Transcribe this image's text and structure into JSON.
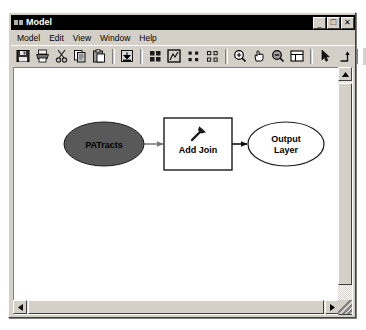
{
  "window": {
    "title": "Model",
    "title_icon": "model-window-icon",
    "controls": [
      {
        "name": "minimize-button",
        "glyph": "_"
      },
      {
        "name": "maximize-button",
        "glyph": "□"
      },
      {
        "name": "close-button",
        "glyph": "✕"
      }
    ]
  },
  "menu": {
    "items": [
      {
        "label": "Model"
      },
      {
        "label": "Edit"
      },
      {
        "label": "View"
      },
      {
        "label": "Window"
      },
      {
        "label": "Help"
      }
    ]
  },
  "toolbar": {
    "buttons": [
      {
        "name": "save-button",
        "icon": "floppy-disk-icon",
        "tip": "Save"
      },
      {
        "name": "print-button",
        "icon": "printer-icon",
        "tip": "Print"
      },
      {
        "name": "cut-button",
        "icon": "scissors-icon",
        "tip": "Cut"
      },
      {
        "name": "copy-button",
        "icon": "copy-pages-icon",
        "tip": "Copy"
      },
      {
        "name": "paste-button",
        "icon": "clipboard-paste-icon",
        "tip": "Paste"
      },
      {
        "name": "add-data-button",
        "icon": "add-data-arrow-icon",
        "tip": "Add Data"
      },
      {
        "name": "auto-layout-button",
        "icon": "grid-squares-icon",
        "tip": "Auto Layout"
      },
      {
        "name": "full-extent-button",
        "icon": "full-extent-icon",
        "tip": "Full Extent"
      },
      {
        "name": "select-all-button",
        "icon": "four-dots-icon",
        "tip": "Select All"
      },
      {
        "name": "deselect-button",
        "icon": "four-dots-outline-icon",
        "tip": "Deselect"
      },
      {
        "name": "zoom-in-button",
        "icon": "magnifier-plus-icon",
        "tip": "Zoom In"
      },
      {
        "name": "pan-button",
        "icon": "hand-pan-icon",
        "tip": "Pan"
      },
      {
        "name": "zoom-out-button",
        "icon": "magnifier-minus-icon",
        "tip": "Zoom Out"
      },
      {
        "name": "zoom-window-button",
        "icon": "zoom-window-icon",
        "tip": "Zoom To Window"
      },
      {
        "name": "select-pointer-button",
        "icon": "arrow-pointer-icon",
        "tip": "Select"
      },
      {
        "name": "connect-button",
        "icon": "connect-elbow-arrow-icon",
        "tip": "Connect"
      },
      {
        "name": "run-button",
        "icon": "play-triangle-icon",
        "tip": "Run"
      }
    ],
    "separator_after": [
      4,
      9,
      13
    ]
  },
  "diagram": {
    "nodes": [
      {
        "name": "input-data-oval",
        "id": "patracts",
        "shape": "ellipse",
        "label_lines": [
          "PATracts"
        ],
        "fill": "#595959",
        "stroke": "#000000",
        "text_color": "#000000",
        "cx": 90,
        "cy": 76,
        "rx": 40,
        "ry": 22
      },
      {
        "name": "tool-rectangle",
        "id": "add-join",
        "shape": "rect",
        "label_lines": [
          "Add Join"
        ],
        "fill": "#ffffff",
        "stroke": "#000000",
        "text_color": "#000000",
        "icon": "hammer-tool-icon",
        "x": 150,
        "y": 50,
        "w": 68,
        "h": 52
      },
      {
        "name": "output-data-oval",
        "id": "output-layer",
        "shape": "ellipse",
        "label_lines": [
          "Output",
          "Layer"
        ],
        "fill": "#ffffff",
        "stroke": "#000000",
        "text_color": "#000000",
        "cx": 272,
        "cy": 76,
        "rx": 38,
        "ry": 22
      }
    ],
    "connectors": [
      {
        "name": "connector-patracts-to-addjoin",
        "from": "patracts",
        "to": "add-join",
        "color": "#808080"
      },
      {
        "name": "connector-addjoin-to-output",
        "from": "add-join",
        "to": "output-layer",
        "color": "#000000"
      }
    ]
  },
  "scrollbars": {
    "vertical": {
      "name": "vertical-scrollbar",
      "up_glyph": "▲",
      "down_glyph": "▼",
      "thumb_top_pct": 2,
      "thumb_height_pct": 90
    },
    "horizontal": {
      "name": "horizontal-scrollbar",
      "left_glyph": "◀",
      "right_glyph": "▶",
      "thumb_left_pct": 1,
      "thumb_width_pct": 96
    },
    "resize_grip": "resize-grip"
  }
}
